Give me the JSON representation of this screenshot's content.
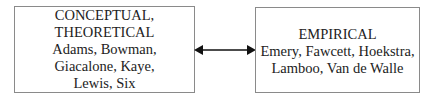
{
  "diagram": {
    "left_box": {
      "lines": [
        "CONCEPTUAL,",
        "THEORETICAL",
        "Adams, Bowman,",
        "Giacalone, Kaye,",
        "Lewis, Six"
      ]
    },
    "right_box": {
      "lines": [
        "EMPIRICAL",
        "Emery, Fawcett, Hoekstra,",
        "Lamboo, Van de Walle"
      ]
    },
    "connector": {
      "type": "bidirectional-arrow",
      "from": "left_box",
      "to": "right_box",
      "color": "#111111"
    },
    "border_color": "#8a8a8a"
  }
}
